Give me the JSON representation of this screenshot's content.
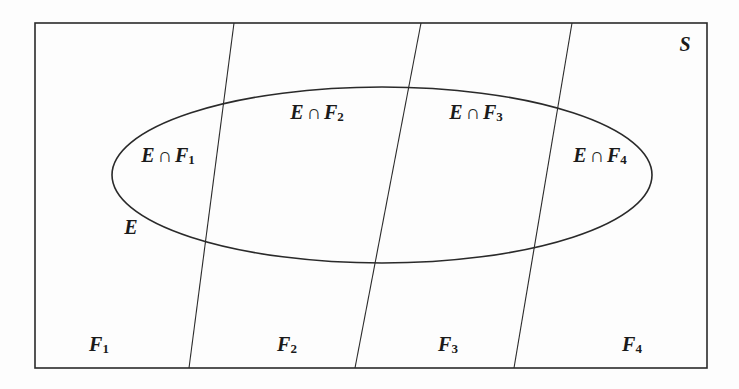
{
  "diagram": {
    "type": "venn-partition",
    "sample_space": {
      "label": "S"
    },
    "event": {
      "label": "E"
    },
    "partitions": [
      {
        "label": "F",
        "sub": "1"
      },
      {
        "label": "F",
        "sub": "2"
      },
      {
        "label": "F",
        "sub": "3"
      },
      {
        "label": "F",
        "sub": "4"
      }
    ],
    "intersections": [
      {
        "left": "E",
        "op": "∩",
        "right": "F",
        "sub": "1"
      },
      {
        "left": "E",
        "op": "∩",
        "right": "F",
        "sub": "2"
      },
      {
        "left": "E",
        "op": "∩",
        "right": "F",
        "sub": "3"
      },
      {
        "left": "E",
        "op": "∩",
        "right": "F",
        "sub": "4"
      }
    ],
    "colors": {
      "stroke": "#2a2a2a",
      "text": "#1a1a1a",
      "background": "#fdfdfd"
    }
  }
}
